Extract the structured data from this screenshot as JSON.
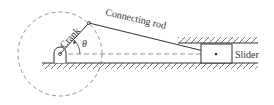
{
  "diagram": {
    "labels": {
      "crank": "Crank",
      "rod": "Connecting rod",
      "slider": "Slider",
      "angle": "θ"
    },
    "colors": {
      "line": "#333333",
      "dashed": "#777777",
      "background": "#ffffff"
    }
  }
}
